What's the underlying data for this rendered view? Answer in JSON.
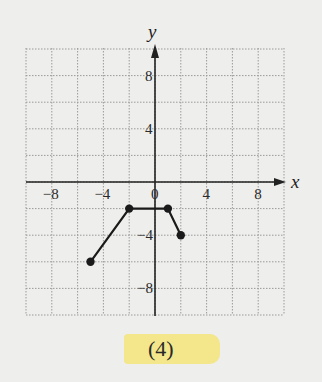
{
  "figure_label": "(4)",
  "highlight_color": "#f3e47a",
  "chart_data": {
    "type": "line",
    "title": "",
    "xlabel": "x",
    "ylabel": "y",
    "xlim": [
      -10,
      10
    ],
    "ylim": [
      -10,
      10
    ],
    "grid": true,
    "grid_step": 2,
    "x_ticks": [
      -8,
      -4,
      0,
      4,
      8
    ],
    "y_ticks": [
      8,
      4,
      -4,
      -8
    ],
    "x_tick_labels": [
      "−8",
      "−4",
      "0",
      "4",
      "8"
    ],
    "y_tick_labels": [
      "8",
      "4",
      "−4",
      "−8"
    ],
    "series": [
      {
        "name": "piecewise",
        "x": [
          -5,
          -2,
          1,
          2
        ],
        "y": [
          -6,
          -2,
          -2,
          -4
        ],
        "markers": "closed-dots"
      }
    ]
  }
}
